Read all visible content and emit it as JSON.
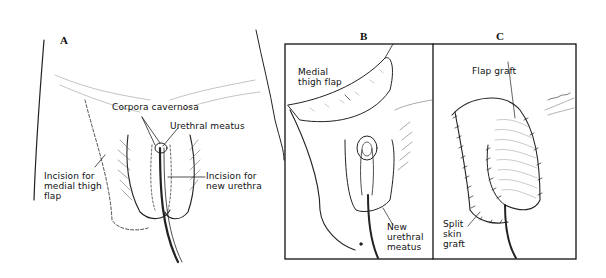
{
  "figure": {
    "panels": [
      {
        "id": "A",
        "label": "A",
        "annotations": {
          "corpora": "Corpora cavernosa",
          "meatus": "Urethral meatus",
          "thigh_incision": "Incision for\nmedial thigh\nflap",
          "urethra_incision": "Incision for\nnew urethra"
        }
      },
      {
        "id": "B",
        "label": "B",
        "annotations": {
          "flap": "Medial\nthigh flap",
          "new_meatus": "New\nurethral\nmeatus"
        }
      },
      {
        "id": "C",
        "label": "C",
        "annotations": {
          "flap_graft": "Flap graft",
          "skin_graft": "Split\nskin\ngraft"
        }
      }
    ],
    "colors": {
      "ink": "#111111",
      "background": "#ffffff"
    }
  }
}
